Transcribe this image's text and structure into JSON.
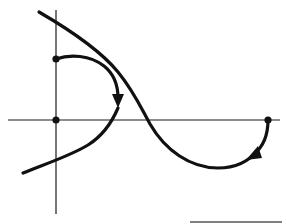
{
  "diagram": {
    "type": "phase-trajectory-sketch",
    "colors": {
      "background": "#ffffff",
      "ink": "#111111",
      "axis": "#1a1a1a"
    },
    "axes": {
      "vertical": {
        "x": 56,
        "y_top": 10,
        "y_bottom": 214
      },
      "horizontal": {
        "y": 120,
        "x_left": 8,
        "x_right": 280
      }
    },
    "points": [
      {
        "name": "start-point-vertical-axis",
        "x": 56,
        "y": 59
      },
      {
        "name": "origin-point",
        "x": 56,
        "y": 120
      },
      {
        "name": "start-point-horizontal-axis",
        "x": 268,
        "y": 120
      }
    ],
    "curves": [
      {
        "name": "s-curve",
        "description": "Long curve from upper-left, crossing the horizontal axis and returning to the lower-left"
      },
      {
        "name": "trajectory-from-vertical-axis",
        "description": "Arc from the point on the vertical axis curving right and down to the S-curve, with arrowhead"
      },
      {
        "name": "trajectory-from-horizontal-axis",
        "description": "Arc from the point on the horizontal axis curving down and left to the S-curve, with arrowhead"
      }
    ],
    "footer_rule": {
      "x1": 190,
      "x2": 282,
      "y": 222
    }
  }
}
